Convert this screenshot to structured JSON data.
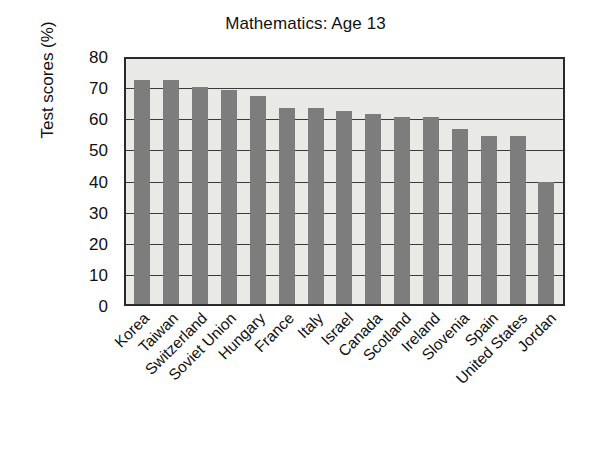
{
  "chart_data": {
    "type": "bar",
    "title": "Mathematics: Age 13",
    "xlabel": "",
    "ylabel": "Test scores (%)",
    "ylim": [
      0,
      80
    ],
    "ytick_step": 10,
    "yticks": [
      80,
      70,
      60,
      50,
      40,
      30,
      20,
      10,
      0
    ],
    "grid": true,
    "legend": "none",
    "bar_color": "#7d7d7d",
    "plot_background": "#e9e9e7",
    "axis_color": "#2a2a2a",
    "categories": [
      "Korea",
      "Taiwan",
      "Switzerland",
      "Soviet Union",
      "Hungary",
      "France",
      "Italy",
      "Israel",
      "Canada",
      "Scotland",
      "Ireland",
      "Slovenia",
      "Spain",
      "United States",
      "Jordan"
    ],
    "values": [
      73,
      73,
      71,
      70,
      68,
      64,
      64,
      63,
      62,
      61,
      61,
      57,
      55,
      55,
      40
    ],
    "series": [
      {
        "name": "Test scores (%)",
        "values": [
          73,
          73,
          71,
          70,
          68,
          64,
          64,
          63,
          62,
          61,
          61,
          57,
          55,
          55,
          40
        ]
      }
    ]
  }
}
